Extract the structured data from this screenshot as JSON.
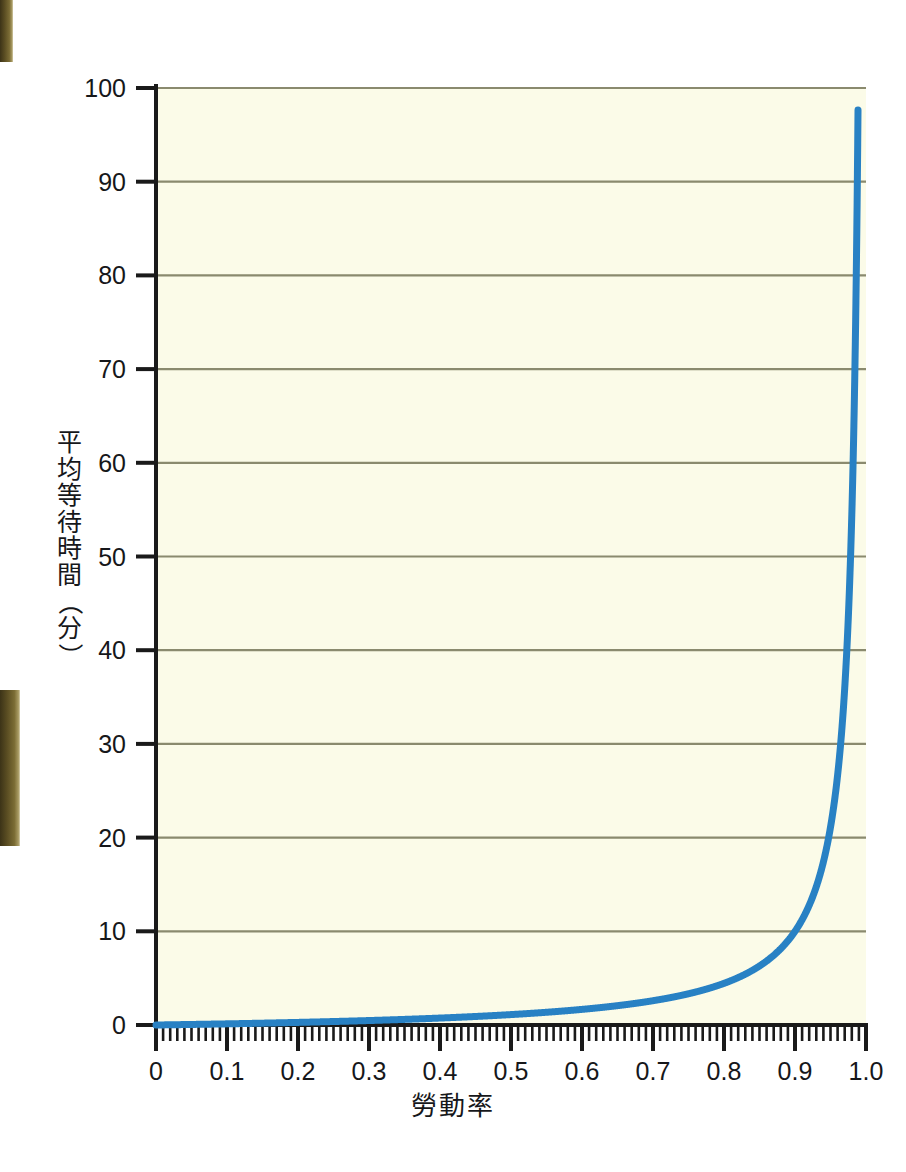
{
  "chart_data": {
    "type": "line",
    "title": "",
    "subtitle": "",
    "xlabel": "勞動率",
    "ylabel": "平均等待時間（分）",
    "ylabel_chars": [
      "平",
      "均",
      "等",
      "待",
      "時",
      "間",
      "（",
      "分",
      "）"
    ],
    "xlim": [
      0.0,
      1.0
    ],
    "ylim": [
      0,
      100
    ],
    "grid": "horizontal-only",
    "legend": "none",
    "x_major_ticks": [
      0.0,
      0.1,
      0.2,
      0.3,
      0.4,
      0.5,
      0.6,
      0.7,
      0.8,
      0.9,
      1.0
    ],
    "x_tick_labels": [
      "0",
      "0.1",
      "0.2",
      "0.3",
      "0.4",
      "0.5",
      "0.6",
      "0.7",
      "0.8",
      "0.9",
      "1.0"
    ],
    "x_minor_tick_step": 0.01,
    "y_major_ticks": [
      0,
      10,
      20,
      30,
      40,
      50,
      60,
      70,
      80,
      90,
      100
    ],
    "y_tick_labels": [
      "0",
      "10",
      "20",
      "30",
      "40",
      "50",
      "60",
      "70",
      "80",
      "90",
      "100"
    ],
    "series": [
      {
        "name": "平均等待時間",
        "color": "#2881c4",
        "line_width": 7,
        "formula": "W = 1.111 * rho / (1 - rho)",
        "x": [
          0.0,
          0.05,
          0.1,
          0.15,
          0.2,
          0.25,
          0.3,
          0.35,
          0.4,
          0.45,
          0.5,
          0.55,
          0.6,
          0.65,
          0.7,
          0.75,
          0.8,
          0.82,
          0.84,
          0.86,
          0.88,
          0.9,
          0.91,
          0.92,
          0.93,
          0.94,
          0.95,
          0.955,
          0.96,
          0.965,
          0.97,
          0.973,
          0.976,
          0.978,
          0.98,
          0.9815
        ],
        "values": [
          0.0,
          0.06,
          0.12,
          0.2,
          0.28,
          0.37,
          0.48,
          0.6,
          0.74,
          0.91,
          1.11,
          1.36,
          1.67,
          2.06,
          2.59,
          3.33,
          4.44,
          5.06,
          5.83,
          6.83,
          8.15,
          10.0,
          11.23,
          12.78,
          14.76,
          17.41,
          21.11,
          23.57,
          26.67,
          30.67,
          36.04,
          40.11,
          45.23,
          49.31,
          54.44,
          59.84
        ]
      }
    ],
    "annotations": []
  },
  "figure": {
    "background": "#ffffff",
    "plot_background": "#fbfbe8",
    "axis_color": "#1a1a1a",
    "grid_color": "#8a8a6e",
    "line_color": "#2881c4",
    "text_color": "#16171a"
  },
  "artifacts": {
    "top_edge_strip": "scan-edge-dark",
    "middle_edge_strip": "scan-edge-dark"
  }
}
